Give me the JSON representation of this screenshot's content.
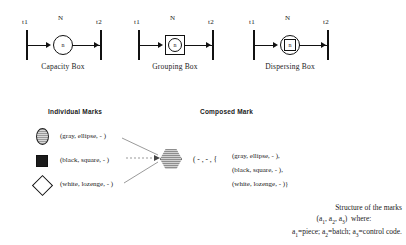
{
  "diagrams": [
    {
      "id": "capacity-box",
      "caption": "Capacity Box",
      "terminal_left": "t1",
      "terminal_right": "t2",
      "arc_label": "N",
      "node_label": "n",
      "node_shape": "circle"
    },
    {
      "id": "grouping-box",
      "caption": "Grouping Box",
      "terminal_left": "t1",
      "terminal_right": "t2",
      "arc_label": "N",
      "node_label": "n",
      "node_shape": "circle-in-square"
    },
    {
      "id": "dispersing-box",
      "caption": "Dispersing Box",
      "terminal_left": "t1",
      "terminal_right": "t2",
      "arc_label": "N",
      "node_label": "n",
      "node_shape": "square-in-circle"
    }
  ],
  "sections": {
    "individual_marks_title": "Individual Marks",
    "composed_mark_title": "Composed Mark"
  },
  "individual_marks": [
    {
      "glyph": "gray-ellipse-icon",
      "text": "(gray, ellipse, - )"
    },
    {
      "glyph": "black-square-icon",
      "text": "(black, square, - )"
    },
    {
      "glyph": "white-lozenge-icon",
      "text": "(white, lozenge, - )"
    }
  ],
  "composed_mark": {
    "glyph": "gray-hexagon-icon",
    "prefix": "( - , - , {",
    "lines": [
      "(gray, ellipse, - ),",
      "(black, square, - ),",
      "(white, lozenge, - )}"
    ]
  },
  "legend": {
    "line1": "Structure of the marks",
    "line2_prefix": "(a",
    "line2": "(a1, a2, a3)  where:",
    "line3": "a1=piece; a2=batch; a3=control code."
  },
  "colors": {
    "ink": "#1a1a1a",
    "gray_fill": "#bdbdbd",
    "black_fill": "#1b1b1b",
    "white_fill": "#ffffff",
    "background": "#ffffff"
  }
}
